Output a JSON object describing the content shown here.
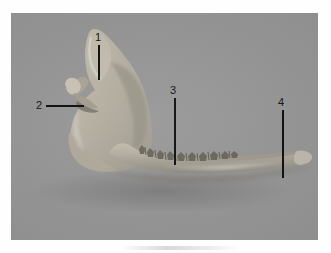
{
  "figure": {
    "type": "anatomical-photograph",
    "background_color": "#979797",
    "bone_color": "#b9b4a8",
    "label_color": "#111111",
    "canvas_color": "#ffffff"
  },
  "labels": [
    {
      "id": "1",
      "text": "1",
      "leader": "vertical",
      "points_to": "coronoid-process"
    },
    {
      "id": "2",
      "text": "2",
      "leader": "horizontal",
      "points_to": "condylar-process"
    },
    {
      "id": "3",
      "text": "3",
      "leader": "vertical",
      "points_to": "alveolar-margin-teeth"
    },
    {
      "id": "4",
      "text": "4",
      "leader": "vertical",
      "points_to": "body-of-mandible"
    }
  ]
}
